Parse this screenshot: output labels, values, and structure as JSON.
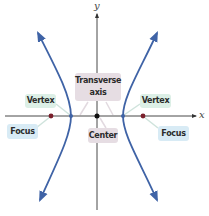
{
  "diagram": {
    "type": "hyperbola",
    "axes": {
      "x_label": "x",
      "y_label": "y"
    },
    "labels": {
      "vertex_left": "Vertex",
      "vertex_right": "Vertex",
      "focus_left": "Focus",
      "focus_right": "Focus",
      "transverse_axis_line1": "Transverse",
      "transverse_axis_line2": "axis",
      "center": "Center"
    },
    "colors": {
      "curve": "#3f63a6",
      "axis": "#333333",
      "focus_point": "#7a1f2b",
      "vertex_point": "#3f63a6",
      "center_point": "#111111",
      "vertex_label_bg": "#dcefe6",
      "focus_label_bg": "#d8ebf5",
      "transverse_label_bg": "#e6dde3",
      "center_label_bg": "#e6dde3"
    }
  }
}
